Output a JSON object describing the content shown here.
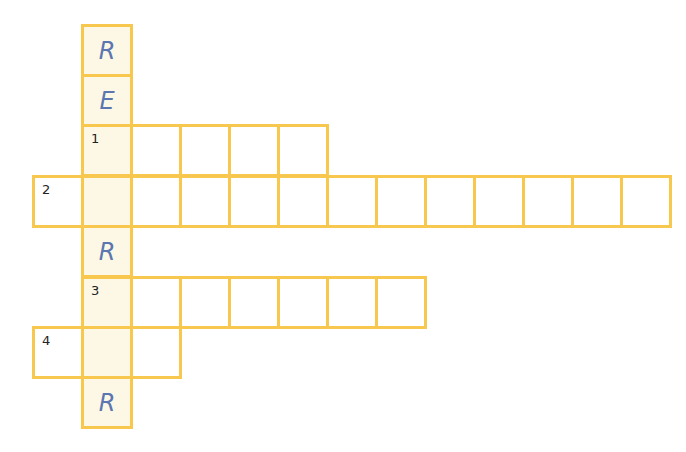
{
  "puzzle": {
    "type": "crossword",
    "key_word_letters": [
      "R",
      "E",
      "",
      "",
      "R",
      "",
      "",
      "R"
    ],
    "rows": [
      {
        "label": "",
        "given": "R"
      },
      {
        "label": "",
        "given": "E"
      },
      {
        "label": "1",
        "given": ""
      },
      {
        "label": "2",
        "given": ""
      },
      {
        "label": "",
        "given": "R"
      },
      {
        "label": "3",
        "given": ""
      },
      {
        "label": "4",
        "given": ""
      },
      {
        "label": "",
        "given": "R"
      }
    ]
  },
  "colors": {
    "border": "#f8c84e",
    "key_column_fill": "#fdf8e6",
    "given_letter": "#5b76b0"
  }
}
